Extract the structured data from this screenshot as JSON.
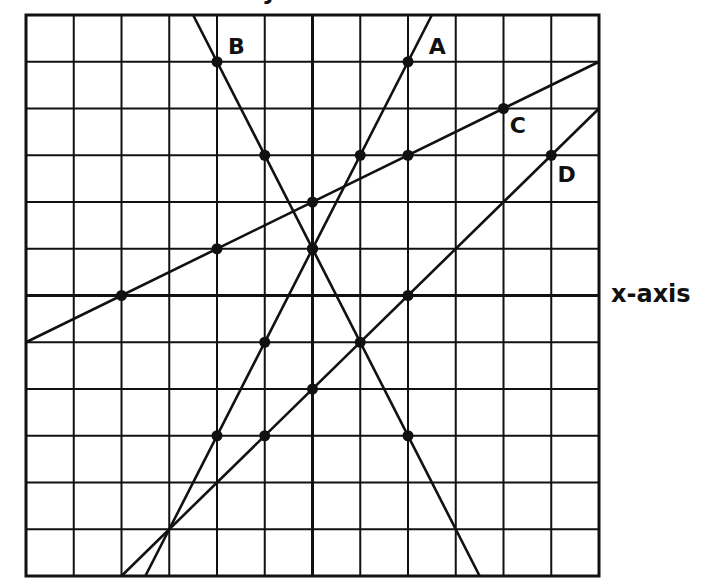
{
  "chart_data": {
    "type": "line",
    "title": "",
    "xlabel": "x-axis",
    "ylabel": "y-axis",
    "xlim": [
      -6,
      6
    ],
    "ylim": [
      -6,
      6
    ],
    "grid": true,
    "grid_step": 1,
    "legend": "none (lines labeled directly)",
    "series": [
      {
        "name": "A",
        "equation": "y = 2x + 1",
        "slope": 2,
        "intercept": 1,
        "points": [
          [
            2,
            5
          ],
          [
            1,
            3
          ],
          [
            0,
            1
          ],
          [
            -1,
            -1
          ],
          [
            -2,
            -3
          ]
        ],
        "label_pos": [
          2.6,
          5.3
        ]
      },
      {
        "name": "B",
        "equation": "y = -2x + 1",
        "slope": -2,
        "intercept": 1,
        "points": [
          [
            -2,
            5
          ],
          [
            -1,
            3
          ],
          [
            0,
            1
          ],
          [
            2,
            -3
          ]
        ],
        "label_pos": [
          -1.6,
          5.3
        ]
      },
      {
        "name": "C",
        "equation": "y = 0.5x + 2",
        "slope": 0.5,
        "intercept": 2,
        "points": [
          [
            4,
            4
          ],
          [
            2,
            3
          ],
          [
            0,
            2
          ],
          [
            -2,
            1
          ],
          [
            -4,
            0
          ]
        ],
        "label_pos": [
          4.3,
          3.6
        ]
      },
      {
        "name": "D",
        "equation": "y = x - 2",
        "slope": 1,
        "intercept": -2,
        "points": [
          [
            5,
            3
          ],
          [
            2,
            0
          ],
          [
            1,
            -1
          ],
          [
            0,
            -2
          ],
          [
            -1,
            -3
          ]
        ],
        "label_pos": [
          5.3,
          2.55
        ]
      }
    ]
  },
  "labels": {
    "x_axis": "x-axis",
    "y_axis": "y-axis"
  },
  "colors": {
    "ink": "#111111",
    "background": "#ffffff"
  }
}
